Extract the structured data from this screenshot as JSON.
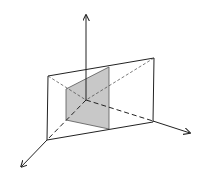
{
  "diagram": {
    "colors": {
      "stroke": "#222222",
      "shaded_fill": "#c8c8c8",
      "background": "#ffffff"
    },
    "axes": [
      {
        "name": "vertical-axis",
        "from": [
          86,
          100
        ],
        "to": [
          86,
          15
        ]
      },
      {
        "name": "right-axis",
        "from": [
          86,
          100
        ],
        "to": [
          190,
          133
        ]
      },
      {
        "name": "front-axis",
        "from": [
          86,
          100
        ],
        "to": [
          21,
          167
        ]
      }
    ],
    "plane_outline": [
      [
        48,
        76
      ],
      [
        154,
        58
      ],
      [
        153,
        122
      ],
      [
        47,
        140
      ]
    ],
    "shaded_plane": [
      [
        66,
        89
      ],
      [
        109,
        67
      ],
      [
        109,
        129
      ],
      [
        66,
        120
      ]
    ]
  }
}
